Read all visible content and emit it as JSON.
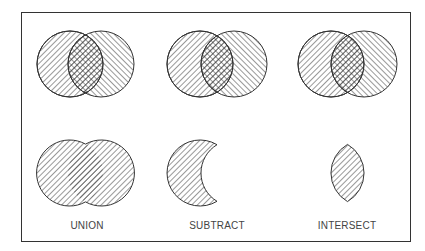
{
  "figure": {
    "operations": [
      {
        "name": "union",
        "label": "UNION"
      },
      {
        "name": "subtract",
        "label": "SUBTRACT"
      },
      {
        "name": "intersect",
        "label": "INTERSECT"
      }
    ]
  },
  "colors": {
    "stroke": "#333333",
    "background": "#ffffff"
  }
}
